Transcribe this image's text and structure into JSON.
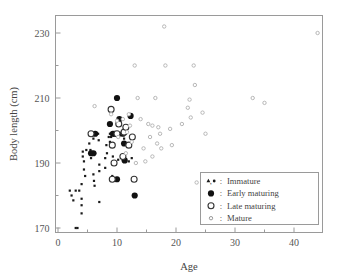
{
  "chart_data": {
    "type": "scatter",
    "title": "",
    "xlabel": "Age",
    "ylabel": "Body length (cm)",
    "xlim": [
      0,
      45
    ],
    "ylim": [
      165,
      235
    ],
    "grid": false,
    "x_major_ticks": [
      0,
      10,
      20,
      30,
      40
    ],
    "x_minor_ticks": [
      5,
      15,
      25,
      35,
      45
    ],
    "y_major_ticks": [
      170,
      190,
      210,
      230
    ],
    "y_minor_ticks": [
      180,
      200,
      220
    ],
    "legend_position": "bottom-right",
    "series": [
      {
        "name": "Immature",
        "marker": "small-filled-dot-and-triangle",
        "color": "#1a1a1a",
        "points": [
          [
            2.0,
            181.5
          ],
          [
            2.3,
            180.0
          ],
          [
            2.6,
            178.5
          ],
          [
            3.0,
            181.5
          ],
          [
            3.0,
            170.0
          ],
          [
            3.3,
            170.0
          ],
          [
            3.6,
            181.5
          ],
          [
            4.0,
            183.5
          ],
          [
            4.0,
            179.0
          ],
          [
            4.0,
            177.0
          ],
          [
            4.0,
            174.5
          ],
          [
            4.2,
            192.0
          ],
          [
            4.2,
            193.5
          ],
          [
            4.4,
            190.5
          ],
          [
            4.4,
            188.0
          ],
          [
            4.6,
            186.0
          ],
          [
            4.8,
            194.0
          ],
          [
            5.3,
            196.0
          ],
          [
            5.5,
            194.0
          ],
          [
            5.6,
            191.5
          ],
          [
            6.0,
            197.5
          ],
          [
            6.0,
            192.5
          ],
          [
            6.0,
            186.5
          ],
          [
            6.1,
            184.5
          ],
          [
            6.2,
            183.0
          ],
          [
            6.3,
            193.0
          ],
          [
            6.8,
            199.0
          ],
          [
            6.9,
            197.0
          ],
          [
            7.0,
            189.5
          ],
          [
            7.0,
            187.5
          ],
          [
            7.0,
            178.0
          ],
          [
            8.0,
            191.5
          ],
          [
            8.0,
            188.5
          ],
          [
            8.2,
            195.5
          ],
          [
            8.3,
            193.0
          ],
          [
            8.6,
            198.0
          ],
          [
            8.8,
            196.5
          ],
          [
            8.8,
            199.0
          ],
          [
            9.0,
            198.0
          ],
          [
            9.0,
            196.0
          ],
          [
            9.2,
            186.0
          ],
          [
            9.3,
            192.0
          ],
          [
            9.5,
            199.0
          ],
          [
            10.0,
            184.5
          ],
          [
            10.2,
            191.0
          ],
          [
            10.5,
            198.5
          ],
          [
            11.0,
            191.0
          ],
          [
            11.2,
            197.5
          ],
          [
            11.5,
            193.0
          ],
          [
            12.0,
            190.5
          ],
          [
            12.5,
            191.5
          ]
        ]
      },
      {
        "name": "Early maturing",
        "marker": "large-filled-circle",
        "color": "#111111",
        "points": [
          [
            5.6,
            193.0
          ],
          [
            6.0,
            193.0
          ],
          [
            6.3,
            199.0
          ],
          [
            8.8,
            202.0
          ],
          [
            9.3,
            199.0
          ],
          [
            9.6,
            199.0
          ],
          [
            10.0,
            210.0
          ],
          [
            10.4,
            203.5
          ],
          [
            11.0,
            199.0
          ],
          [
            11.2,
            196.0
          ],
          [
            11.3,
            190.8
          ],
          [
            12.3,
            204.5
          ],
          [
            13.0,
            180.0
          ],
          [
            10.0,
            185.0
          ]
        ]
      },
      {
        "name": "Late maturing",
        "marker": "large-open-circle",
        "color": "#333333",
        "points": [
          [
            5.6,
            199.0
          ],
          [
            9.0,
            206.5
          ],
          [
            9.2,
            195.5
          ],
          [
            9.2,
            185.0
          ],
          [
            9.5,
            190.0
          ],
          [
            10.0,
            199.0
          ],
          [
            10.3,
            202.0
          ],
          [
            11.2,
            199.5
          ],
          [
            11.5,
            201.0
          ],
          [
            12.0,
            195.5
          ],
          [
            12.6,
            198.0
          ],
          [
            12.9,
            185.0
          ],
          [
            11.0,
            192.0
          ]
        ]
      },
      {
        "name": "Mature",
        "marker": "small-open-circle",
        "color": "#b8b8b8",
        "points": [
          [
            6.2,
            207.5
          ],
          [
            9.0,
            205.0
          ],
          [
            10.0,
            203.0
          ],
          [
            10.2,
            198.0
          ],
          [
            11.0,
            203.5
          ],
          [
            11.5,
            193.0
          ],
          [
            11.7,
            199.5
          ],
          [
            12.0,
            205.0
          ],
          [
            12.2,
            201.5
          ],
          [
            12.5,
            196.5
          ],
          [
            13.0,
            220.0
          ],
          [
            13.2,
            190.0
          ],
          [
            13.5,
            210.0
          ],
          [
            14.0,
            203.5
          ],
          [
            14.5,
            194.5
          ],
          [
            14.8,
            190.5
          ],
          [
            15.3,
            202.0
          ],
          [
            15.6,
            198.0
          ],
          [
            16.0,
            201.5
          ],
          [
            16.0,
            192.0
          ],
          [
            16.5,
            210.0
          ],
          [
            16.8,
            196.0
          ],
          [
            17.0,
            201.0
          ],
          [
            17.3,
            199.0
          ],
          [
            17.5,
            194.5
          ],
          [
            18.0,
            232.0
          ],
          [
            18.2,
            220.0
          ],
          [
            19.0,
            200.5
          ],
          [
            19.3,
            195.5
          ],
          [
            21.0,
            202.0
          ],
          [
            22.0,
            207.0
          ],
          [
            22.3,
            209.5
          ],
          [
            22.5,
            204.0
          ],
          [
            23.0,
            220.0
          ],
          [
            23.2,
            214.0
          ],
          [
            23.5,
            184.0
          ],
          [
            24.5,
            205.5
          ],
          [
            25.0,
            199.0
          ],
          [
            25.3,
            183.0
          ],
          [
            33.0,
            210.0
          ],
          [
            35.0,
            208.5
          ],
          [
            44.0,
            230.0
          ]
        ]
      }
    ]
  },
  "legend": {
    "items": [
      {
        "marker_label": "▲, ●",
        "separator": ":",
        "label": "Immature"
      },
      {
        "marker_label": "●",
        "separator": ":",
        "label": "Early maturing"
      },
      {
        "marker_label": "○",
        "separator": ":",
        "label": "Late maturing"
      },
      {
        "marker_label": "∘",
        "separator": ":",
        "label": "Mature"
      }
    ]
  },
  "axis_labels": {
    "x_0": "0",
    "x_10": "10",
    "x_20": "20",
    "x_30": "30",
    "x_40": "40",
    "y_170": "170",
    "y_190": "190",
    "y_210": "210",
    "y_230": "230"
  },
  "colors": {
    "frame": "#9a9a9a",
    "text": "#555555",
    "immature": "#1a1a1a",
    "early": "#111111",
    "late": "#333333",
    "mature": "#b8b8b8"
  }
}
